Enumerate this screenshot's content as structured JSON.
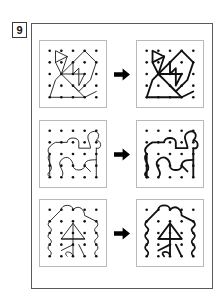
{
  "page": {
    "exercise_number": "9",
    "background_color": "#ffffff",
    "frame_color": "#5a5a5a",
    "panel_border_color": "#b9b9b9",
    "ink_color": "#111111",
    "arrow_color": "#000000",
    "arrow_icon": "right-arrow-icon"
  },
  "chart_data": {
    "type": "table",
    "title": "",
    "grid": {
      "rows": 5,
      "cols": 5,
      "dot_radius": 1.35
    },
    "rows": [
      {
        "index": 1,
        "name": "angular-polygon-figure",
        "source_stroke_width": 0.9,
        "target_stroke_width": 1.9,
        "paths": [
          "M10,58 L22,58 L34,58 L46,58 L58,52",
          "M10,58 L16,40 L22,34 L16,22 L16,10 L28,16",
          "M16,22 L28,16",
          "M28,16 L22,34 L34,46 L46,58",
          "M22,34 L34,22 L46,10 L58,22 L52,40 L40,52 L34,46",
          "M34,22 L34,34 L46,34 L40,46 L40,28 L34,34",
          "M22,34 L34,34"
        ]
      },
      {
        "index": 2,
        "name": "wavy-jigsaw-figure",
        "source_stroke_width": 0.9,
        "target_stroke_width": 1.9,
        "paths": [
          "M10,58 L10,34 C4,28 16,22 16,22 L28,22 C28,16 40,16 40,22 L40,28 L52,28 C52,22 46,16 52,12 C58,8 64,14 58,20 C64,20 64,30 58,28",
          "M10,34 C4,40 16,46 10,52 C4,58 16,58 10,58",
          "M22,58 C28,52 16,46 22,40 C28,34 34,40 34,46 C34,52 46,52 46,46 C46,40 52,40 58,40",
          "M58,28 L58,58",
          "M46,46 L52,52"
        ]
      },
      {
        "index": 3,
        "name": "arrow-in-puzzle-figure",
        "source_stroke_width": 0.9,
        "target_stroke_width": 1.9,
        "paths": [
          "M10,22 L22,10 C22,4 34,4 34,10 C40,4 46,10 46,16 L58,22",
          "M10,22 C4,28 16,28 10,34 C4,40 16,40 10,46 C4,52 16,52 10,58",
          "M58,22 C64,28 52,28 58,34 C64,40 52,40 58,46 C64,52 52,52 58,58",
          "M22,40 L34,24 L46,40 Z",
          "M34,24 L34,58",
          "M22,40 L46,40",
          "M34,46 L22,52",
          "M28,58 C22,52 34,52 34,58",
          "M40,46 L46,58"
        ]
      }
    ]
  }
}
